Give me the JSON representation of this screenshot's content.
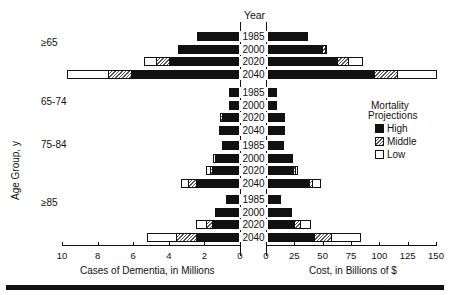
{
  "chart_data": {
    "type": "bar",
    "subtype": "back-to-back stacked horizontal bar (population pyramid style)",
    "title": "",
    "center_label": "Year",
    "ylabel": "Age Group, y",
    "left_panel": {
      "xlabel": "Cases of Dementia, in Millions",
      "xlim": [
        10,
        0
      ],
      "ticks": [
        "10",
        "8",
        "6",
        "4",
        "2",
        "0"
      ]
    },
    "right_panel": {
      "xlabel": "Cost, in Billions of $",
      "xlim": [
        0,
        150
      ],
      "ticks": [
        "0",
        "25",
        "50",
        "75",
        "100",
        "125",
        "150"
      ]
    },
    "legend": {
      "title_line1": "Mortality",
      "title_line2": "Projections",
      "entries": [
        {
          "name": "High",
          "fill": "solid black"
        },
        {
          "name": "Middle",
          "fill": "hatched"
        },
        {
          "name": "Low",
          "fill": "white"
        }
      ],
      "position": "right-middle"
    },
    "note": "Stacked cumulative: High (black) bar length, Middle extends to middle projection, Low extends to low-mortality projection total.",
    "groups": [
      {
        "age_group": "≥65",
        "years": [
          "1985",
          "2000",
          "2020",
          "2040"
        ],
        "cases_millions": {
          "high": [
            2.4,
            3.4,
            4.0,
            6.1
          ],
          "middle": [
            2.4,
            3.5,
            4.7,
            7.4
          ],
          "low": [
            2.4,
            3.5,
            5.4,
            9.7
          ]
        },
        "cost_billions": {
          "high": [
            36,
            49,
            63,
            95
          ],
          "middle": [
            36,
            52,
            72,
            116
          ],
          "low": [
            36,
            53,
            85,
            150
          ]
        }
      },
      {
        "age_group": "65-74",
        "years": [
          "1985",
          "2000",
          "2020",
          "2040"
        ],
        "cases_millions": {
          "high": [
            0.6,
            0.6,
            1.0,
            1.1
          ],
          "middle": [
            0.6,
            0.6,
            1.1,
            1.2
          ],
          "low": [
            0.6,
            0.6,
            1.1,
            1.2
          ]
        },
        "cost_billions": {
          "high": [
            9,
            9,
            15,
            15
          ],
          "middle": [
            9,
            9,
            16,
            16
          ],
          "low": [
            9,
            9,
            16,
            16
          ]
        }
      },
      {
        "age_group": "75-84",
        "years": [
          "1985",
          "2000",
          "2020",
          "2040"
        ],
        "cases_millions": {
          "high": [
            1.0,
            1.4,
            1.6,
            2.5
          ],
          "middle": [
            1.0,
            1.4,
            1.7,
            2.9
          ],
          "low": [
            1.0,
            1.5,
            1.9,
            3.3
          ]
        },
        "cost_billions": {
          "high": [
            15,
            23,
            24,
            38
          ],
          "middle": [
            15,
            23,
            26,
            41
          ],
          "low": [
            15,
            23,
            27,
            48
          ]
        }
      },
      {
        "age_group": "≥85",
        "years": [
          "1985",
          "2000",
          "2020",
          "2040"
        ],
        "cases_millions": {
          "high": [
            0.8,
            1.4,
            1.6,
            2.5
          ],
          "middle": [
            0.8,
            1.4,
            1.9,
            3.6
          ],
          "low": [
            0.8,
            1.4,
            2.5,
            5.2
          ]
        },
        "cost_billions": {
          "high": [
            12,
            22,
            25,
            42
          ],
          "middle": [
            12,
            22,
            30,
            57
          ],
          "low": [
            12,
            22,
            39,
            83
          ]
        }
      }
    ]
  },
  "labels": {
    "year_header": "Year",
    "y_axis": "Age Group, y",
    "left_xlabel": "Cases of Dementia, in Millions",
    "right_xlabel": "Cost, in Billions of $",
    "legend_title_1": "Mortality",
    "legend_title_2": "Projections",
    "legend_high": "High",
    "legend_middle": "Middle",
    "legend_low": "Low",
    "group_0": "≥65",
    "group_1": "65-74",
    "group_2": "75-84",
    "group_3": "≥85"
  }
}
